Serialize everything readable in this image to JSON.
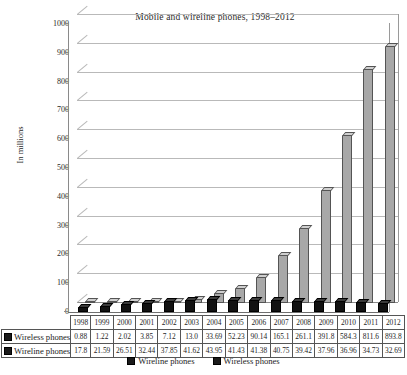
{
  "chart_data": {
    "type": "bar",
    "title": "Mobile and wireline phones, 1998–2012",
    "xlabel": "",
    "ylabel": "In millions",
    "ylim": [
      0,
      1000
    ],
    "yticks": [
      0,
      100,
      200,
      300,
      400,
      500,
      600,
      700,
      800,
      900,
      1000
    ],
    "grid": true,
    "legend_position": "bottom",
    "categories": [
      "1998",
      "1999",
      "2000",
      "2001",
      "2002",
      "2003",
      "2004",
      "2005",
      "2006",
      "2007",
      "2008",
      "2009",
      "2010",
      "2011",
      "2012"
    ],
    "series": [
      {
        "name": "Wireless phones",
        "color": "#a8a8a8",
        "values": [
          0.88,
          1.22,
          2.02,
          3.85,
          7.12,
          13.0,
          33.69,
          52.23,
          90.14,
          165.1,
          261.1,
          391.8,
          584.3,
          811.6,
          893.8
        ],
        "labels": [
          "0.88",
          "1.22",
          "2.02",
          "3.85",
          "7.12",
          "13.0",
          "33.69",
          "52.23",
          "90.14",
          "165.1",
          "261.1",
          "391.8",
          "584.3",
          "811.6",
          "893.8"
        ]
      },
      {
        "name": "Wireline phones",
        "color": "#111111",
        "values": [
          17.8,
          21.59,
          26.51,
          32.44,
          37.85,
          41.62,
          43.95,
          41.43,
          41.38,
          40.75,
          39.42,
          37.96,
          36.96,
          34.73,
          32.69
        ],
        "labels": [
          "17.8",
          "21.59",
          "26.51",
          "32.44",
          "37.85",
          "41.62",
          "43.95",
          "41.43",
          "41.38",
          "40.75",
          "39.42",
          "37.96",
          "36.96",
          "34.73",
          "32.69"
        ]
      }
    ]
  },
  "table": {
    "row_headers": [
      "Wireless phones",
      "Wireline phones"
    ]
  },
  "legend": {
    "items": [
      {
        "label": "Wireline phones",
        "color": "#1a1a1a"
      },
      {
        "label": "Wireless phones",
        "color": "#1a1a1a"
      }
    ]
  }
}
